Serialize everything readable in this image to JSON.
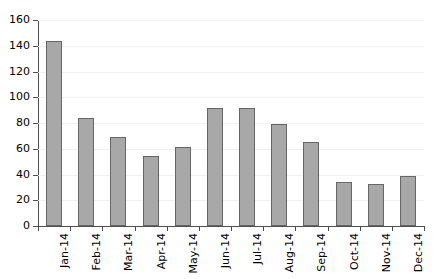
{
  "chart_data": {
    "type": "bar",
    "title": "",
    "subtitle": "",
    "xlabel": "",
    "ylabel": "",
    "categories": [
      "Jan-14",
      "Feb-14",
      "Mar-14",
      "Apr-14",
      "May-14",
      "Jun-14",
      "Jul-14",
      "Aug-14",
      "Sep-14",
      "Oct-14",
      "Nov-14",
      "Dec-14"
    ],
    "values": [
      144,
      84,
      69,
      54,
      61,
      92,
      92,
      79.5,
      65,
      34.5,
      33,
      38.5
    ],
    "ylim": [
      0,
      160
    ],
    "ytick_labels": [
      "0",
      "20",
      "40",
      "60",
      "80",
      "100",
      "120",
      "140",
      "160"
    ],
    "ytick_values": [
      0,
      20,
      40,
      60,
      80,
      100,
      120,
      140,
      160
    ],
    "grid": true,
    "grid_axis": "y",
    "legend": false,
    "legend_position": "none",
    "xtick_label_rotation": -90,
    "bar_fill_color": "#a8a8a8",
    "bar_edge_color": "#666666",
    "axis_color": "#4d4d4d",
    "gridline_color": "#f0f0f0",
    "background_color": "#ffffff"
  }
}
